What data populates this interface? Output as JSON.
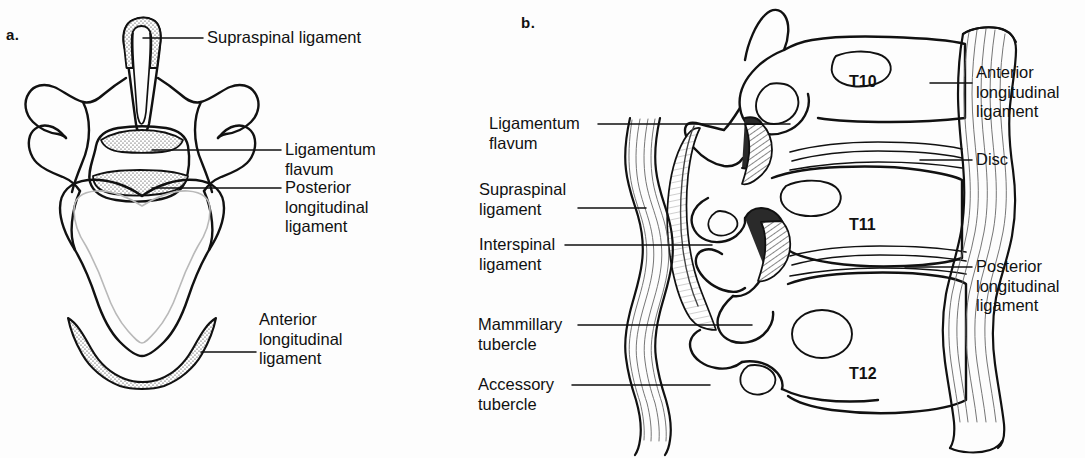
{
  "figure": {
    "background_color": "#fdfdfd",
    "ink_color": "#111111"
  },
  "panels": [
    {
      "id": "a",
      "letter": "a.",
      "view": "superior view of a lumbar vertebra",
      "labels": [
        {
          "name": "supraspinal-ligament",
          "text": "Supraspinal  ligament"
        },
        {
          "name": "ligamentum-flavum",
          "text": "Ligamentum\nflavum"
        },
        {
          "name": "posterior-longitudinal-ligament",
          "text": "Posterior\nlongitudinal\nligament"
        },
        {
          "name": "anterior-longitudinal-ligament",
          "text": "Anterior\nlongitudinal\nligament"
        }
      ]
    },
    {
      "id": "b",
      "letter": "b.",
      "view": "lateral sagittal view of thoracic vertebrae T10-T12",
      "vertebrae": [
        "T10",
        "T11",
        "T12"
      ],
      "labels_left": [
        {
          "name": "ligamentum-flavum",
          "text": "Ligamentum\nflavum"
        },
        {
          "name": "supraspinal-ligament",
          "text": "Supraspinal\nligament"
        },
        {
          "name": "interspinal-ligament",
          "text": "Interspinal\nligament"
        },
        {
          "name": "mammillary-tubercle",
          "text": "Mammillary\ntubercle"
        },
        {
          "name": "accessory-tubercle",
          "text": "Accessory\ntubercle"
        }
      ],
      "labels_right": [
        {
          "name": "anterior-longitudinal-ligament",
          "text": "Anterior\nlongitudinal\nligament"
        },
        {
          "name": "disc",
          "text": "Disc"
        },
        {
          "name": "posterior-longitudinal-ligament",
          "text": "Posterior\nlongitudinal\nligament"
        }
      ]
    }
  ]
}
